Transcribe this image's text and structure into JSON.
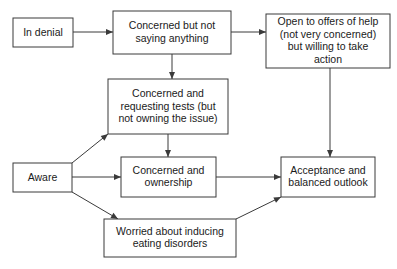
{
  "diagram": {
    "background_color": "#ffffff",
    "box_stroke_color": "#3a3a3a",
    "text_color": "#1a1a1a",
    "arrow_color": "#3a3a3a",
    "nodes": [
      {
        "id": "in-denial",
        "label": "In denial",
        "lines": [
          "In denial"
        ],
        "x": 13,
        "y": 18,
        "w": 60,
        "h": 29
      },
      {
        "id": "concerned-not-saying",
        "label": "Concerned but not saying anything",
        "lines": [
          "Concerned but not",
          "saying anything"
        ],
        "x": 113,
        "y": 11,
        "w": 118,
        "h": 43
      },
      {
        "id": "open-to-offers",
        "label": "Open to offers of help (not very concerned) but willing to take action",
        "lines": [
          "Open to offers of help",
          "(not very concerned)",
          "but willing to take",
          "action"
        ],
        "x": 266,
        "y": 14,
        "w": 124,
        "h": 54
      },
      {
        "id": "concerned-requesting-tests",
        "label": "Concerned and requesting tests (but not owning the issue)",
        "lines": [
          "Concerned and",
          "requesting tests (but",
          "not owning the issue)"
        ],
        "x": 108,
        "y": 79,
        "w": 120,
        "h": 55
      },
      {
        "id": "aware",
        "label": "Aware",
        "lines": [
          "Aware"
        ],
        "x": 13,
        "y": 163,
        "w": 59,
        "h": 29
      },
      {
        "id": "concerned-ownership",
        "label": "Concerned and ownership",
        "lines": [
          "Concerned and",
          "ownership"
        ],
        "x": 121,
        "y": 157,
        "w": 95,
        "h": 40
      },
      {
        "id": "acceptance",
        "label": "Acceptance and balanced outlook",
        "lines": [
          "Acceptance and",
          "balanced outlook"
        ],
        "x": 281,
        "y": 157,
        "w": 94,
        "h": 40
      },
      {
        "id": "worried-eating-disorders",
        "label": "Worried about inducing eating disorders",
        "lines": [
          "Worried about inducing",
          "eating disorders"
        ],
        "x": 104,
        "y": 219,
        "w": 132,
        "h": 38
      }
    ],
    "edges": [
      {
        "id": "e1",
        "from": "in-denial",
        "to": "concerned-not-saying",
        "points": "73,32 113,32"
      },
      {
        "id": "e2",
        "from": "concerned-not-saying",
        "to": "open-to-offers",
        "points": "231,32 266,32"
      },
      {
        "id": "e3",
        "from": "concerned-not-saying",
        "to": "concerned-requesting-tests",
        "points": "172,54 172,79"
      },
      {
        "id": "e4",
        "from": "concerned-requesting-tests",
        "to": "concerned-ownership",
        "points": "168,134 168,157"
      },
      {
        "id": "e5",
        "from": "open-to-offers",
        "to": "acceptance",
        "points": "330,68 330,157"
      },
      {
        "id": "e6",
        "from": "aware",
        "to": "concerned-requesting-tests",
        "points": "72,163 108,134"
      },
      {
        "id": "e7",
        "from": "aware",
        "to": "concerned-ownership",
        "points": "72,177 121,177"
      },
      {
        "id": "e8",
        "from": "aware",
        "to": "worried-eating-disorders",
        "points": "72,192 118,219"
      },
      {
        "id": "e9",
        "from": "concerned-ownership",
        "to": "acceptance",
        "points": "216,177 281,177"
      },
      {
        "id": "e10",
        "from": "worried-eating-disorders",
        "to": "acceptance",
        "points": "236,219 281,197"
      }
    ]
  }
}
